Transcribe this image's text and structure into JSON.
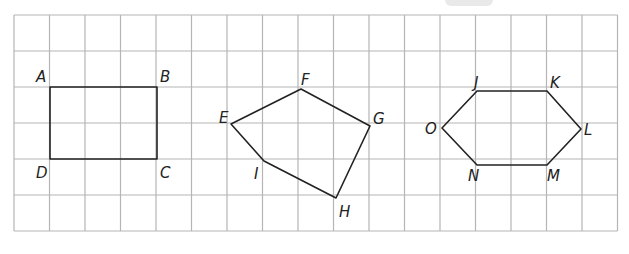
{
  "diagram": {
    "type": "grid-polygons",
    "grid": {
      "left": 14,
      "top": 15,
      "cell_w": 35.5,
      "cell_h": 36,
      "cols": 17,
      "rows": 6,
      "color": "#b5b5b5"
    },
    "stroke_color": "#222222",
    "shapes": [
      {
        "name": "rectangle-ABCD",
        "vertices": [
          {
            "label": "A",
            "x": 50,
            "y": 87,
            "lx": 36,
            "ly": 82
          },
          {
            "label": "B",
            "x": 157,
            "y": 87,
            "lx": 160,
            "ly": 82
          },
          {
            "label": "C",
            "x": 157,
            "y": 159,
            "lx": 160,
            "ly": 178
          },
          {
            "label": "D",
            "x": 50,
            "y": 159,
            "lx": 36,
            "ly": 178
          }
        ]
      },
      {
        "name": "pentagon-EFGHI",
        "vertices": [
          {
            "label": "E",
            "x": 231,
            "y": 124,
            "lx": 219,
            "ly": 123
          },
          {
            "label": "F",
            "x": 301,
            "y": 89,
            "lx": 301,
            "ly": 85
          },
          {
            "label": "G",
            "x": 370,
            "y": 126,
            "lx": 373,
            "ly": 124
          },
          {
            "label": "H",
            "x": 336,
            "y": 198,
            "lx": 339,
            "ly": 217
          },
          {
            "label": "I",
            "x": 264,
            "y": 161,
            "lx": 254,
            "ly": 179
          }
        ]
      },
      {
        "name": "hexagon-JKLMNO",
        "vertices": [
          {
            "label": "J",
            "x": 477,
            "y": 91,
            "lx": 474,
            "ly": 88
          },
          {
            "label": "K",
            "x": 547,
            "y": 91,
            "lx": 550,
            "ly": 88
          },
          {
            "label": "L",
            "x": 581,
            "y": 129,
            "lx": 584,
            "ly": 135
          },
          {
            "label": "M",
            "x": 547,
            "y": 165,
            "lx": 547,
            "ly": 181
          },
          {
            "label": "N",
            "x": 477,
            "y": 165,
            "lx": 468,
            "ly": 181
          },
          {
            "label": "O",
            "x": 442,
            "y": 128,
            "lx": 425,
            "ly": 134
          }
        ]
      }
    ]
  }
}
